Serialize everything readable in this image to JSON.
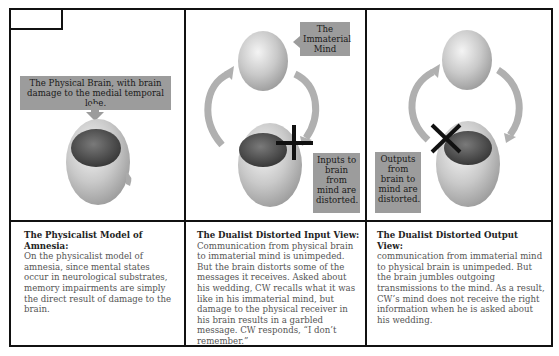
{
  "panels": [
    {
      "id": "physicalist",
      "labels": {
        "brain": "The Physical Brain, with brain damage to the medial temporal lobe."
      },
      "caption": {
        "title": "The Physicalist Model of Amnesia:",
        "body": "On the physicalist model of amnesia, since mental states occur in neurological substrates, memory impairments are simply the direct result of damage to the brain."
      }
    },
    {
      "id": "dualist-input",
      "labels": {
        "mind": "The Immaterial Mind",
        "distortion": "Inputs to brain from mind are distorted."
      },
      "caption": {
        "title": "The Dualist Distorted Input View:",
        "body": "Communication from physical brain to immaterial mind is unimpeded. But the brain distorts some of the messages it receives. Asked about his wedding, CW recalls what it was like in his immaterial mind, but damage to the physical receiver in his brain results in a garbled message. CW responds, “I don’t remember.”"
      }
    },
    {
      "id": "dualist-output",
      "labels": {
        "distortion": "Outputs from brain to mind are distorted."
      },
      "caption": {
        "title": "The Dualist Distorted Output View:",
        "body": "communication from immaterial mind to physical brain is unimpeded. But the brain jumbles outgoing transmissions to the mind. As a result, CW’s mind does not receive the right information when he is asked about his wedding."
      }
    }
  ],
  "colors": {
    "label_bg": "#9c9c9c",
    "border": "#111111",
    "orb": "#c8c8c8",
    "brain": "#4a4a4a"
  }
}
